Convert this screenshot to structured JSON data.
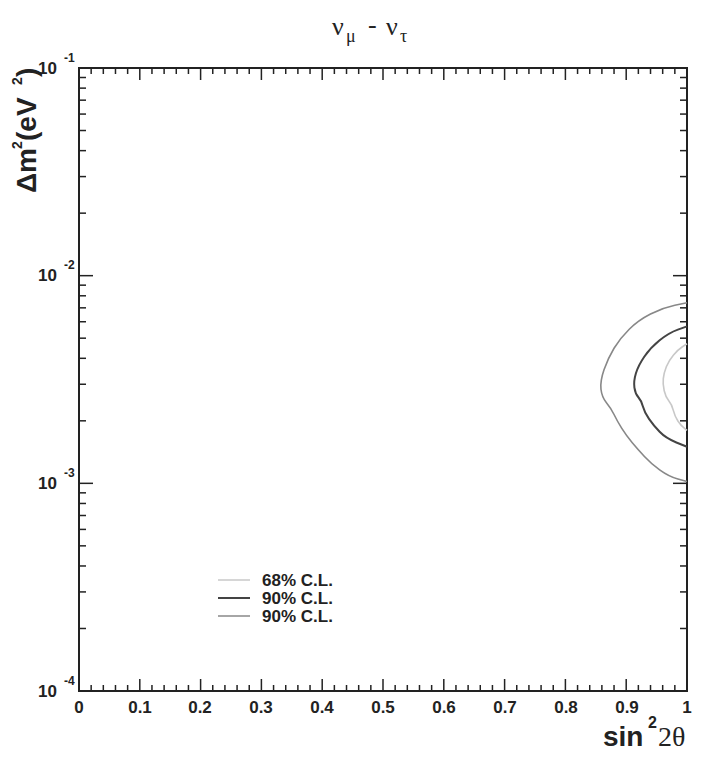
{
  "chart_data": {
    "type": "line",
    "title_parts": {
      "main1": "ν",
      "sub1": "μ",
      "dash": "-",
      "main2": "ν",
      "sub2": "τ"
    },
    "xlabel": "sin²2θ",
    "xlabel_parts": {
      "base": "sin",
      "sup": "2",
      "rest": "2θ"
    },
    "ylabel": "Δm² (eV²)",
    "ylabel_parts": {
      "delta": "Δm",
      "sup": "2",
      "rest": " (eV",
      "sup2": "2",
      "close": ")"
    },
    "xlim": [
      0,
      1
    ],
    "ylim": [
      0.0001,
      0.1
    ],
    "yscale": "log",
    "grid": false,
    "x_ticks": [
      "0",
      "0.1",
      "0.2",
      "0.3",
      "0.4",
      "0.5",
      "0.6",
      "0.7",
      "0.8",
      "0.9",
      "1"
    ],
    "y_ticks": [
      {
        "base": "10",
        "exp": "-1"
      },
      {
        "base": "10",
        "exp": "-2"
      },
      {
        "base": "10",
        "exp": "-3"
      },
      {
        "base": "10",
        "exp": "-4"
      }
    ],
    "legend": {
      "position": "lower-left",
      "entries": [
        {
          "label": "68% C.L.",
          "color": "#c8c8c8"
        },
        {
          "label": "90% C.L.",
          "color": "#444444"
        },
        {
          "label": "90% C.L.",
          "color": "#888888"
        }
      ]
    },
    "series": [
      {
        "name": "68% C.L.",
        "color": "#c8c8c8",
        "points": [
          [
            1.0,
            0.0047
          ],
          [
            0.985,
            0.0044
          ],
          [
            0.97,
            0.0039
          ],
          [
            0.962,
            0.0034
          ],
          [
            0.96,
            0.003
          ],
          [
            0.965,
            0.0026
          ],
          [
            0.975,
            0.0024
          ],
          [
            0.98,
            0.0021
          ],
          [
            0.99,
            0.0019
          ],
          [
            1.0,
            0.0018
          ]
        ]
      },
      {
        "name": "90% C.L.",
        "color": "#444444",
        "points": [
          [
            1.0,
            0.0057
          ],
          [
            0.97,
            0.0053
          ],
          [
            0.94,
            0.0045
          ],
          [
            0.92,
            0.0037
          ],
          [
            0.912,
            0.0031
          ],
          [
            0.915,
            0.0027
          ],
          [
            0.925,
            0.0025
          ],
          [
            0.93,
            0.0022
          ],
          [
            0.945,
            0.0019
          ],
          [
            0.965,
            0.00165
          ],
          [
            1.0,
            0.0015
          ]
        ]
      },
      {
        "name": "90% C.L.",
        "color": "#888888",
        "points": [
          [
            1.0,
            0.0074
          ],
          [
            0.96,
            0.007
          ],
          [
            0.92,
            0.0061
          ],
          [
            0.89,
            0.005
          ],
          [
            0.87,
            0.004
          ],
          [
            0.857,
            0.0031
          ],
          [
            0.86,
            0.0026
          ],
          [
            0.875,
            0.0023
          ],
          [
            0.885,
            0.002
          ],
          [
            0.9,
            0.0017
          ],
          [
            0.92,
            0.00145
          ],
          [
            0.94,
            0.00125
          ],
          [
            0.97,
            0.00108
          ],
          [
            1.0,
            0.00102
          ]
        ]
      }
    ]
  }
}
